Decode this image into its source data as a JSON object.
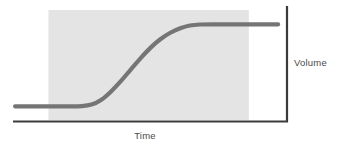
{
  "chart_data": {
    "type": "line",
    "title": "",
    "xlabel": "Time",
    "ylabel": "Volume",
    "legend": [],
    "grid": false,
    "annotations": [],
    "xlim": [
      0,
      100
    ],
    "ylim": [
      0,
      100
    ],
    "axis_ticks": {
      "x": [],
      "y": []
    },
    "series": [
      {
        "name": "Volume over time",
        "shape": "sigmoid",
        "points": [
          {
            "x": 0.4,
            "y": 12.4
          },
          {
            "x": 10.0,
            "y": 12.4
          },
          {
            "x": 20.0,
            "y": 12.4
          },
          {
            "x": 25.1,
            "y": 12.6
          },
          {
            "x": 28.8,
            "y": 14.0
          },
          {
            "x": 32.5,
            "y": 18.5
          },
          {
            "x": 36.1,
            "y": 26.0
          },
          {
            "x": 39.8,
            "y": 35.5
          },
          {
            "x": 43.4,
            "y": 45.9
          },
          {
            "x": 47.1,
            "y": 56.3
          },
          {
            "x": 50.8,
            "y": 65.8
          },
          {
            "x": 54.4,
            "y": 73.4
          },
          {
            "x": 58.1,
            "y": 79.3
          },
          {
            "x": 61.8,
            "y": 83.4
          },
          {
            "x": 65.4,
            "y": 85.9
          },
          {
            "x": 69.1,
            "y": 86.8
          },
          {
            "x": 75.0,
            "y": 87.0
          },
          {
            "x": 85.0,
            "y": 87.0
          },
          {
            "x": 98.2,
            "y": 87.0
          }
        ]
      }
    ],
    "shaded_region": {
      "label": "",
      "orientation": "vertical-band",
      "x_start": 12.8,
      "x_end": 87.3,
      "y_start": 0.0,
      "y_end": 100.0,
      "color": "#e4e4e4"
    },
    "colors": {
      "curve": "#757575",
      "axis": "#3b3b3b",
      "shaded_band": "#e4e4e4",
      "label_text": "#4a4a4a",
      "background": "#ffffff"
    }
  },
  "figure": {
    "xlabel": "Time",
    "ylabel": "Volume"
  }
}
